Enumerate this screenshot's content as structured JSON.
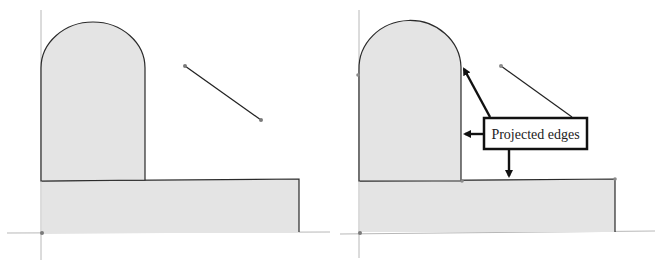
{
  "diagram": {
    "type": "sketch-projection-illustration",
    "panels": [
      {
        "id": "before",
        "description": "Sketch with profile shapes and a line segment, no projected edges"
      },
      {
        "id": "after",
        "description": "Same sketch with projected edges highlighted via callout"
      }
    ],
    "callout": {
      "label": "Projected edges",
      "arrow_count": 3
    },
    "colors": {
      "fill": "#e4e4e4",
      "stroke": "#2a2a2a",
      "axis": "#b0b0b0",
      "point": "#7a7a7a",
      "callout_border": "#111111"
    }
  }
}
